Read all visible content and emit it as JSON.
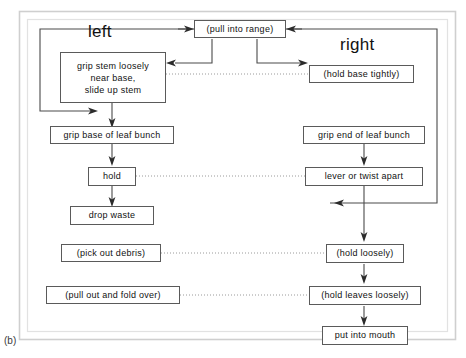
{
  "figure": {
    "label": "(b)"
  },
  "columns": {
    "left_title": "left",
    "right_title": "right"
  },
  "nodes": {
    "pull_into_range": "(pull into range)",
    "grip_stem_loosely": "grip stem loosely\nnear base,\nslide up stem",
    "hold_base_tightly": "(hold base tightly)",
    "grip_base_of_leaf_bunch": "grip base of leaf bunch",
    "grip_end_of_leaf_bunch": "grip end of leaf bunch",
    "hold": "hold",
    "lever_or_twist_apart": "lever or twist apart",
    "drop_waste": "drop waste",
    "pick_out_debris": "(pick out debris)",
    "hold_loosely": "(hold loosely)",
    "pull_out_and_fold_over": "(pull out and fold over)",
    "hold_leaves_loosely": "(hold leaves loosely)",
    "put_into_mouth": "put into mouth"
  },
  "colors": {
    "line": "#4a4a4a",
    "box_border": "#5a5a5a",
    "frame": "#c9c9c9",
    "text": "#111111",
    "background": "#ffffff"
  }
}
